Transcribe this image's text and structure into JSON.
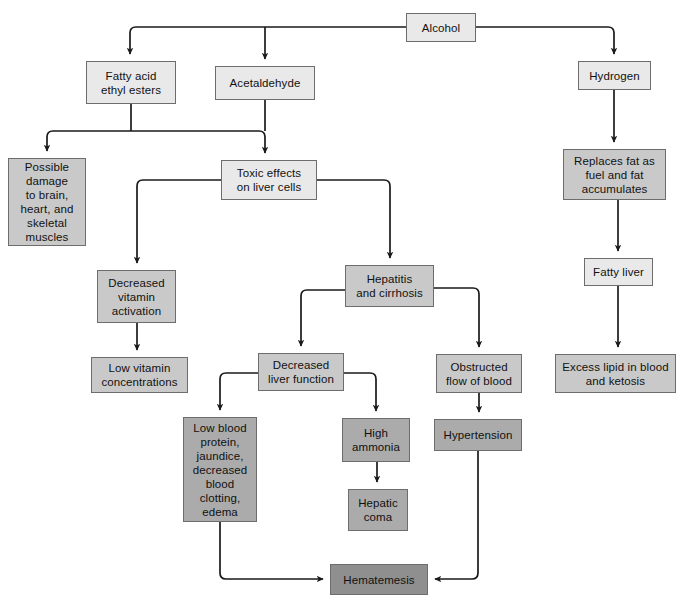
{
  "diagram": {
    "background": "#ffffff",
    "line_color": "#1a1a1a",
    "tones": {
      "light": "#e9e9e9",
      "mid": "#c9c9c9",
      "dark": "#ababab",
      "darker": "#8f8f8f"
    }
  },
  "nodes": [
    {
      "id": "alcohol",
      "label": "Alcohol",
      "tone": "light",
      "x": 406,
      "y": 13,
      "w": 70,
      "h": 29
    },
    {
      "id": "fatty_esters",
      "label": "Fatty acid\nethyl esters",
      "tone": "light",
      "x": 86,
      "y": 61,
      "w": 90,
      "h": 43
    },
    {
      "id": "acetaldehyde",
      "label": "Acetaldehyde",
      "tone": "light",
      "x": 215,
      "y": 66,
      "w": 100,
      "h": 34
    },
    {
      "id": "hydrogen",
      "label": "Hydrogen",
      "tone": "light",
      "x": 578,
      "y": 61,
      "w": 73,
      "h": 29
    },
    {
      "id": "possible_damage",
      "label": "Possible\ndamage\nto brain,\nheart, and\nskeletal\nmuscles",
      "tone": "mid",
      "x": 8,
      "y": 158,
      "w": 78,
      "h": 88
    },
    {
      "id": "toxic_effects",
      "label": "Toxic effects\non liver cells",
      "tone": "light",
      "x": 221,
      "y": 160,
      "w": 96,
      "h": 40
    },
    {
      "id": "replaces_fat",
      "label": "Replaces fat as\nfuel and fat\naccumulates",
      "tone": "mid",
      "x": 563,
      "y": 149,
      "w": 103,
      "h": 51
    },
    {
      "id": "decr_vitamin",
      "label": "Decreased\nvitamin\nactivation",
      "tone": "mid",
      "x": 97,
      "y": 270,
      "w": 79,
      "h": 53
    },
    {
      "id": "hepatitis",
      "label": "Hepatitis\nand cirrhosis",
      "tone": "mid",
      "x": 345,
      "y": 265,
      "w": 89,
      "h": 42
    },
    {
      "id": "fatty_liver",
      "label": "Fatty liver",
      "tone": "light",
      "x": 584,
      "y": 258,
      "w": 69,
      "h": 28
    },
    {
      "id": "low_vitamin",
      "label": "Low vitamin\nconcentrations",
      "tone": "mid",
      "x": 91,
      "y": 357,
      "w": 97,
      "h": 36
    },
    {
      "id": "decr_liver_fn",
      "label": "Decreased\nliver function",
      "tone": "mid",
      "x": 258,
      "y": 353,
      "w": 86,
      "h": 38
    },
    {
      "id": "obstructed",
      "label": "Obstructed\nflow of blood",
      "tone": "mid",
      "x": 436,
      "y": 354,
      "w": 86,
      "h": 39
    },
    {
      "id": "excess_lipid",
      "label": "Excess lipid in blood\nand ketosis",
      "tone": "mid",
      "x": 555,
      "y": 354,
      "w": 121,
      "h": 39
    },
    {
      "id": "low_blood_prot",
      "label": "Low blood\nprotein,\njaundice,\ndecreased\nblood\nclotting,\nedema",
      "tone": "dark",
      "x": 183,
      "y": 417,
      "w": 74,
      "h": 105
    },
    {
      "id": "high_ammonia",
      "label": "High\nammonia",
      "tone": "dark",
      "x": 342,
      "y": 418,
      "w": 68,
      "h": 44
    },
    {
      "id": "hypertension",
      "label": "Hypertension",
      "tone": "dark",
      "x": 434,
      "y": 419,
      "w": 88,
      "h": 32
    },
    {
      "id": "hepatic_coma",
      "label": "Hepatic\ncoma",
      "tone": "dark",
      "x": 348,
      "y": 489,
      "w": 60,
      "h": 42
    },
    {
      "id": "hematemesis",
      "label": "Hematemesis",
      "tone": "darker",
      "x": 330,
      "y": 564,
      "w": 98,
      "h": 31
    }
  ],
  "edges": [
    {
      "id": "alcohol-to-bus-left",
      "from": "alcohol",
      "to": "fatty_esters",
      "arrow": true
    },
    {
      "id": "alcohol-to-acetaldehyde",
      "from": "alcohol",
      "to": "acetaldehyde",
      "arrow": true
    },
    {
      "id": "alcohol-to-hydrogen",
      "from": "alcohol",
      "to": "hydrogen",
      "arrow": true
    },
    {
      "id": "esters-to-possible-damage",
      "from": "fatty_esters",
      "to": "possible_damage",
      "arrow": true
    },
    {
      "id": "esters-to-toxic",
      "from": "fatty_esters",
      "to": "toxic_effects",
      "arrow": false
    },
    {
      "id": "acetaldehyde-to-toxic",
      "from": "acetaldehyde",
      "to": "toxic_effects",
      "arrow": true
    },
    {
      "id": "hydrogen-to-replaces-fat",
      "from": "hydrogen",
      "to": "replaces_fat",
      "arrow": true
    },
    {
      "id": "toxic-to-decr-vitamin",
      "from": "toxic_effects",
      "to": "decr_vitamin",
      "arrow": true
    },
    {
      "id": "toxic-to-hepatitis",
      "from": "toxic_effects",
      "to": "hepatitis",
      "arrow": true
    },
    {
      "id": "replaces-to-fatty-liver",
      "from": "replaces_fat",
      "to": "fatty_liver",
      "arrow": true
    },
    {
      "id": "vitamin-to-low-vitamin",
      "from": "decr_vitamin",
      "to": "low_vitamin",
      "arrow": true
    },
    {
      "id": "hepatitis-to-decr-liver",
      "from": "hepatitis",
      "to": "decr_liver_fn",
      "arrow": true
    },
    {
      "id": "hepatitis-to-obstructed",
      "from": "hepatitis",
      "to": "obstructed",
      "arrow": true
    },
    {
      "id": "fatty-liver-to-excess",
      "from": "fatty_liver",
      "to": "excess_lipid",
      "arrow": true
    },
    {
      "id": "liverfn-to-low-blood",
      "from": "decr_liver_fn",
      "to": "low_blood_prot",
      "arrow": true
    },
    {
      "id": "liverfn-to-ammonia",
      "from": "decr_liver_fn",
      "to": "high_ammonia",
      "arrow": true
    },
    {
      "id": "obstructed-to-hypertension",
      "from": "obstructed",
      "to": "hypertension",
      "arrow": true
    },
    {
      "id": "ammonia-to-coma",
      "from": "high_ammonia",
      "to": "hepatic_coma",
      "arrow": true
    },
    {
      "id": "lowblood-to-hematemesis",
      "from": "low_blood_prot",
      "to": "hematemesis",
      "arrow": true
    },
    {
      "id": "hypertension-to-hematemesis",
      "from": "hypertension",
      "to": "hematemesis",
      "arrow": true
    }
  ]
}
